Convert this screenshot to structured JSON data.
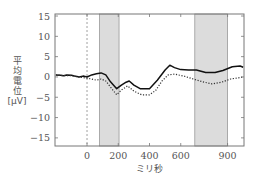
{
  "chart_data": {
    "type": "line",
    "title": "",
    "xlabel": "ミリ秒",
    "ylabel": [
      "平",
      "均",
      "電",
      "位",
      "[μV]"
    ],
    "xlim": [
      -205,
      1005
    ],
    "ylim": [
      -17,
      15.5
    ],
    "x_ticks": [
      0,
      200,
      400,
      600,
      900
    ],
    "x_tick_labels": [
      "0",
      "200",
      "400",
      "600",
      "900"
    ],
    "y_ticks": [
      15,
      10,
      5,
      0,
      -5,
      -10,
      -15
    ],
    "y_tick_labels": [
      "15",
      "10",
      "5",
      "0",
      "−5",
      "−10",
      "−15"
    ],
    "grid": false,
    "legend": "none",
    "vertical_reference_line": 0,
    "shaded_regions": [
      {
        "from": 80,
        "to": 205
      },
      {
        "from": 690,
        "to": 900
      }
    ],
    "series": [
      {
        "name": "solid",
        "style": "solid",
        "color": "#111111",
        "x": [
          -200,
          -170,
          -150,
          -130,
          -100,
          -80,
          -50,
          -20,
          0,
          30,
          60,
          90,
          120,
          150,
          190,
          220,
          250,
          270,
          300,
          340,
          400,
          450,
          500,
          530,
          560,
          600,
          650,
          700,
          760,
          820,
          870,
          930,
          980,
          1000
        ],
        "y": [
          0.5,
          0.4,
          0.3,
          0.5,
          0.4,
          0.2,
          0.0,
          0.2,
          0.0,
          0.5,
          0.8,
          1.0,
          0.5,
          -1.2,
          -2.9,
          -2.0,
          -1.3,
          -1.0,
          -2.0,
          -2.9,
          -2.9,
          -0.8,
          1.7,
          2.9,
          2.3,
          1.8,
          1.7,
          1.7,
          1.1,
          1.1,
          1.6,
          2.5,
          2.7,
          2.4
        ]
      },
      {
        "name": "dotted",
        "style": "dotted",
        "color": "#333333",
        "x": [
          -200,
          -150,
          -100,
          -50,
          0,
          30,
          60,
          90,
          120,
          150,
          190,
          220,
          260,
          300,
          350,
          400,
          440,
          480,
          520,
          560,
          620,
          680,
          740,
          800,
          860,
          920,
          970,
          1000
        ],
        "y": [
          0.5,
          0.3,
          0.3,
          0.0,
          -0.3,
          -0.5,
          -0.8,
          -0.5,
          -1.0,
          -2.5,
          -4.4,
          -3.2,
          -2.2,
          -3.5,
          -4.4,
          -4.4,
          -3.3,
          -1.0,
          0.5,
          0.7,
          0.2,
          -0.5,
          -1.2,
          -1.7,
          -1.3,
          -0.5,
          -0.2,
          0.0
        ]
      }
    ]
  },
  "colors": {
    "shade": "#dcdcdc",
    "shade_edge": "#9a9a9a",
    "axis": "#777777"
  }
}
